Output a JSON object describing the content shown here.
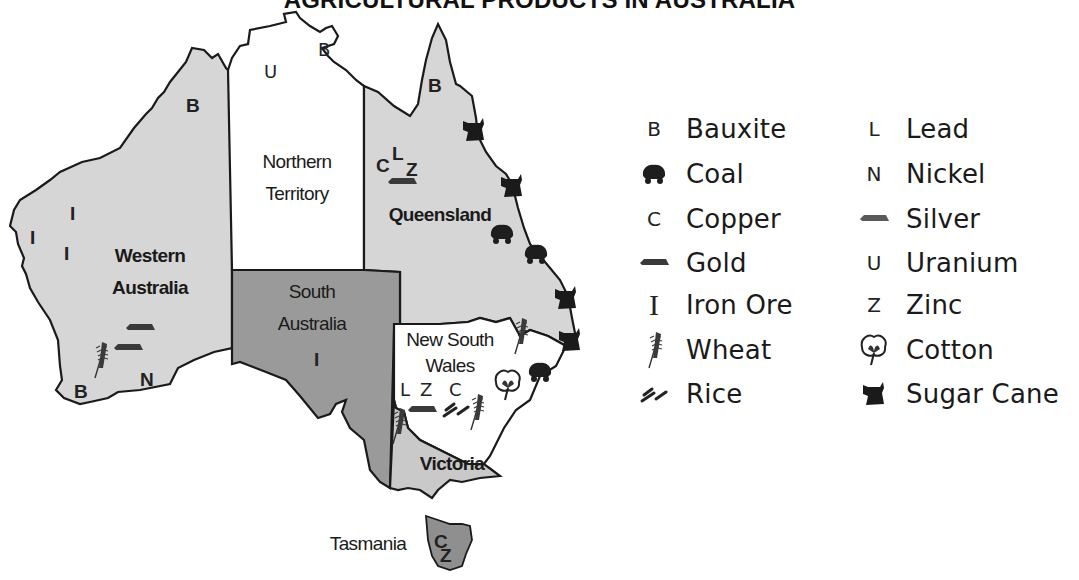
{
  "title": "AGRICULTURAL PRODUCTS IN AUSTRALIA",
  "colors": {
    "western_australia": "#d6d6d6",
    "northern_territory": "#ffffff",
    "queensland": "#d6d6d6",
    "south_australia": "#9a9a9a",
    "new_south_wales": "#ffffff",
    "victoria": "#c9c9c9",
    "tasmania": "#8f8f8f",
    "border": "#1a1a1a",
    "symbol": "#222222"
  },
  "regions": [
    {
      "name": "Western Australia",
      "line1": "Western",
      "line2": "Australia",
      "symbols": [
        "B",
        "I",
        "I",
        "I",
        "Gold",
        "Silver",
        "Wheat",
        "B",
        "N"
      ]
    },
    {
      "name": "Northern Territory",
      "line1": "Northern",
      "line2": "Territory",
      "symbols": [
        "U",
        "B"
      ]
    },
    {
      "name": "Queensland",
      "line1": "Queensland",
      "symbols": [
        "B",
        "C",
        "L",
        "Z",
        "Silver",
        "Sugar Cane",
        "Sugar Cane",
        "Coal",
        "Coal",
        "Sugar Cane"
      ]
    },
    {
      "name": "South Australia",
      "line1": "South",
      "line2": "Australia",
      "symbols": [
        "I"
      ]
    },
    {
      "name": "New South Wales",
      "line1": "New South",
      "line2": "Wales",
      "symbols": [
        "L",
        "Z",
        "C",
        "Silver",
        "Rice",
        "Wheat",
        "Wheat",
        "Cotton",
        "Coal",
        "Sugar Cane"
      ]
    },
    {
      "name": "Victoria",
      "line1": "Victoria",
      "symbols": [
        "Wheat"
      ]
    },
    {
      "name": "Tasmania",
      "line1": "Tasmania",
      "symbols": [
        "C",
        "Z"
      ]
    }
  ],
  "map_letters": {
    "wa_b_north": "B",
    "wa_i1": "I",
    "wa_i2": "I",
    "wa_i3": "I",
    "wa_b_south": "B",
    "wa_n": "N",
    "nt_u": "U",
    "nt_b": "B",
    "qld_b": "B",
    "qld_c": "C",
    "qld_l": "L",
    "qld_z": "Z",
    "sa_i": "I",
    "nsw_l": "L",
    "nsw_z": "Z",
    "nsw_c": "C",
    "tas_c": "C",
    "tas_z": "Z"
  },
  "legend": {
    "left": [
      {
        "symbol": "B",
        "icon": "bauxite-letter",
        "label": "Bauxite"
      },
      {
        "symbol": "",
        "icon": "coal-cart-icon",
        "label": "Coal"
      },
      {
        "symbol": "C",
        "icon": "copper-letter",
        "label": "Copper"
      },
      {
        "symbol": "",
        "icon": "gold-bar-icon",
        "label": "Gold"
      },
      {
        "symbol": "I",
        "icon": "iron-ore-letter",
        "label": "Iron Ore"
      },
      {
        "symbol": "",
        "icon": "wheat-icon",
        "label": "Wheat"
      },
      {
        "symbol": "",
        "icon": "rice-icon",
        "label": "Rice"
      }
    ],
    "right": [
      {
        "symbol": "L",
        "icon": "lead-letter",
        "label": "Lead"
      },
      {
        "symbol": "N",
        "icon": "nickel-letter",
        "label": "Nickel"
      },
      {
        "symbol": "",
        "icon": "silver-bar-icon",
        "label": "Silver"
      },
      {
        "symbol": "U",
        "icon": "uranium-letter",
        "label": "Uranium"
      },
      {
        "symbol": "Z",
        "icon": "zinc-letter",
        "label": "Zinc"
      },
      {
        "symbol": "",
        "icon": "cotton-icon",
        "label": "Cotton"
      },
      {
        "symbol": "",
        "icon": "sugar-cane-icon",
        "label": "Sugar Cane"
      }
    ]
  }
}
